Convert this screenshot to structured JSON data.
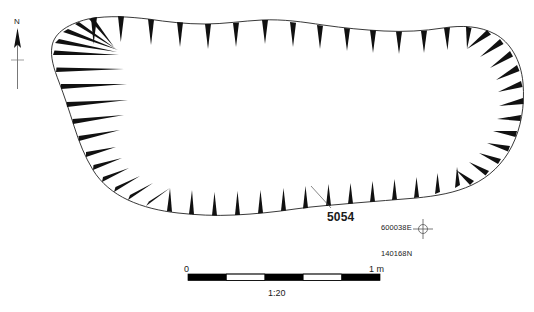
{
  "figure": {
    "type": "archaeological-site-plan",
    "background_color": "#ffffff",
    "ink_color": "#1a1a1a"
  },
  "north_arrow": {
    "label": "N",
    "icon": "north-arrow-icon"
  },
  "feature": {
    "context_number": "5054",
    "hachure_style": "tapered-wedge",
    "outline_closed": true
  },
  "survey_point": {
    "easting": "600038E",
    "northing": "140168N",
    "icon": "survey-crosshair-icon"
  },
  "scale_bar": {
    "min_label": "0",
    "max_label": "1 m",
    "ratio_label": "1:20",
    "segments": 5,
    "segment_colors": [
      "#000000",
      "#ffffff",
      "#000000",
      "#ffffff",
      "#000000"
    ]
  }
}
